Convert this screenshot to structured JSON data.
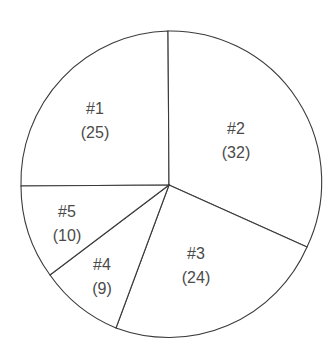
{
  "chart_data": {
    "type": "pie",
    "title": "",
    "categories": [
      "#1",
      "#2",
      "#3",
      "#4",
      "#5"
    ],
    "values": [
      25,
      32,
      24,
      9,
      10
    ],
    "labels": [
      "#1",
      "#2",
      "#3",
      "#4",
      "#5"
    ],
    "value_labels": [
      "(25)",
      "(32)",
      "(24)",
      "(9)",
      "(10)"
    ],
    "start_angle_deg": 0,
    "direction": "clockwise",
    "legend": "none",
    "fill_color": "#ffffff",
    "stroke_color": "#3a3a3a"
  },
  "geometry": {
    "cx": 169,
    "cy": 185,
    "r": 151,
    "slices": [
      {
        "name": "#1",
        "label_pos": [
          95,
          108
        ],
        "value_pos": [
          95,
          132
        ],
        "from": [
          21,
          186
        ],
        "to": [
          168,
          31
        ],
        "large_arc": 0
      },
      {
        "name": "#2",
        "label_pos": [
          236,
          128
        ],
        "value_pos": [
          236,
          152
        ],
        "from": [
          168,
          31
        ],
        "to": [
          307,
          247
        ],
        "large_arc": 0
      },
      {
        "name": "#3",
        "label_pos": [
          196,
          253
        ],
        "value_pos": [
          196,
          277
        ],
        "from": [
          307,
          247
        ],
        "to": [
          116,
          328
        ],
        "large_arc": 0
      },
      {
        "name": "#4",
        "label_pos": [
          102,
          264
        ],
        "value_pos": [
          102,
          288
        ],
        "from": [
          116,
          328
        ],
        "to": [
          50,
          275
        ],
        "large_arc": 0
      },
      {
        "name": "#5",
        "label_pos": [
          67,
          211
        ],
        "value_pos": [
          67,
          235
        ],
        "from": [
          50,
          275
        ],
        "to": [
          21,
          186
        ],
        "large_arc": 0
      }
    ]
  }
}
